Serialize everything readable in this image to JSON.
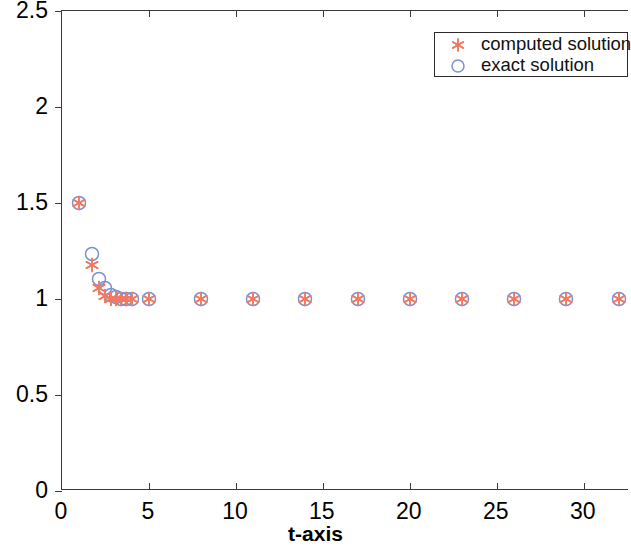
{
  "chart_data": {
    "type": "scatter",
    "title": "",
    "xlabel": "t-axis",
    "ylabel": "x-axis",
    "xlim": [
      0,
      32.6
    ],
    "ylim": [
      0,
      2.5
    ],
    "xticks": [
      0,
      5,
      10,
      15,
      20,
      25,
      30
    ],
    "xtick_labels": [
      "0",
      "5",
      "10",
      "15",
      "20",
      "25",
      "30"
    ],
    "yticks": [
      0,
      0.5,
      1,
      1.5,
      2,
      2.5
    ],
    "ytick_labels": [
      "0",
      "0.5",
      "1",
      "1.5",
      "2",
      "2.5"
    ],
    "grid": false,
    "legend_position": "top-right",
    "series": [
      {
        "name": "computed solution",
        "marker": "asterisk",
        "color": "#ef7a62",
        "points": [
          {
            "x": 1.0,
            "y": 1.5
          },
          {
            "x": 1.7,
            "y": 1.175
          },
          {
            "x": 2.1,
            "y": 1.055
          },
          {
            "x": 2.45,
            "y": 1.015
          },
          {
            "x": 2.8,
            "y": 1.002
          },
          {
            "x": 3.1,
            "y": 1.0
          },
          {
            "x": 3.4,
            "y": 1.0
          },
          {
            "x": 3.7,
            "y": 1.0
          },
          {
            "x": 4.0,
            "y": 1.0
          },
          {
            "x": 5.0,
            "y": 1.0
          },
          {
            "x": 8.0,
            "y": 1.0
          },
          {
            "x": 11.0,
            "y": 1.0
          },
          {
            "x": 14.0,
            "y": 1.0
          },
          {
            "x": 17.0,
            "y": 1.0
          },
          {
            "x": 20.0,
            "y": 1.0
          },
          {
            "x": 23.0,
            "y": 1.0
          },
          {
            "x": 26.0,
            "y": 1.0
          },
          {
            "x": 29.0,
            "y": 1.0
          },
          {
            "x": 32.0,
            "y": 1.0
          }
        ]
      },
      {
        "name": "exact solution",
        "marker": "circle",
        "color": "#7b8fd4",
        "points": [
          {
            "x": 1.0,
            "y": 1.5
          },
          {
            "x": 1.7,
            "y": 1.235
          },
          {
            "x": 2.1,
            "y": 1.105
          },
          {
            "x": 2.45,
            "y": 1.055
          },
          {
            "x": 2.8,
            "y": 1.022
          },
          {
            "x": 3.1,
            "y": 1.008
          },
          {
            "x": 3.4,
            "y": 1.0
          },
          {
            "x": 3.7,
            "y": 1.0
          },
          {
            "x": 4.0,
            "y": 1.0
          },
          {
            "x": 5.0,
            "y": 1.0
          },
          {
            "x": 8.0,
            "y": 1.0
          },
          {
            "x": 11.0,
            "y": 1.0
          },
          {
            "x": 14.0,
            "y": 1.0
          },
          {
            "x": 17.0,
            "y": 1.0
          },
          {
            "x": 20.0,
            "y": 1.0
          },
          {
            "x": 23.0,
            "y": 1.0
          },
          {
            "x": 26.0,
            "y": 1.0
          },
          {
            "x": 29.0,
            "y": 1.0
          },
          {
            "x": 32.0,
            "y": 1.0
          }
        ]
      }
    ]
  },
  "legend": {
    "entries": [
      {
        "label": "computed solution",
        "marker": "asterisk",
        "color": "#ef7a62"
      },
      {
        "label": "exact solution",
        "marker": "circle",
        "color": "#7b8fd4"
      }
    ]
  },
  "axes": {
    "xlabel": "t-axis",
    "ylabel": "x-axis"
  }
}
